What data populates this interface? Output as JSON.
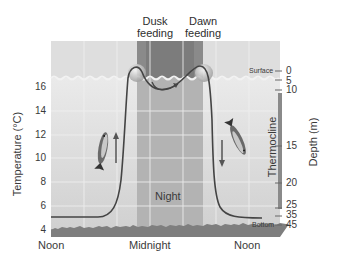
{
  "diagram": {
    "top_labels": {
      "dusk": [
        "Dusk",
        "feeding"
      ],
      "dawn": [
        "Dawn",
        "feeding"
      ]
    },
    "y_axis_left": {
      "title": "Temperature (°C)",
      "ticks": [
        "16",
        "14",
        "12",
        "10",
        "8",
        "6",
        "4"
      ]
    },
    "y_axis_right": {
      "title": "Depth (m)",
      "ticks": [
        "0",
        "5",
        "10",
        "15",
        "20",
        "25",
        "35",
        "45"
      ],
      "zone_label": "Thermocline"
    },
    "x_axis": {
      "ticks": [
        "Noon",
        "Midnight",
        "Noon"
      ]
    },
    "region_labels": {
      "night": "Night",
      "surface": "Surface",
      "bottom": "Bottom"
    },
    "colors": {
      "surface_band": "#dcdcdc",
      "night_dark": "#8c8c8c",
      "night_mid": "#b4b4b4",
      "water": "#d6d6d6",
      "curve": "#4a4a4a",
      "thermocline_bar": "#8a8a8a"
    },
    "icons": [
      "fish-ascending",
      "fish-descending",
      "arrow-up",
      "arrow-down",
      "feeding-bubble"
    ]
  }
}
